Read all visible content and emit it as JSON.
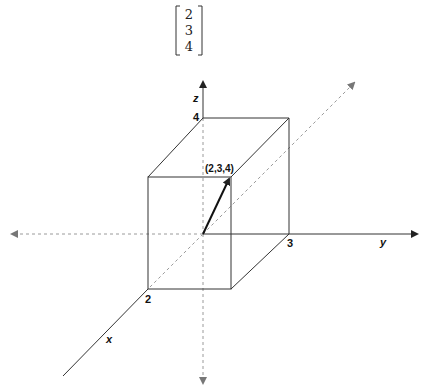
{
  "matrix": {
    "entries": [
      "2",
      "3",
      "4"
    ]
  },
  "axes": {
    "x_label": "x",
    "y_label": "y",
    "z_label": "z"
  },
  "ticks": {
    "x": "2",
    "y": "3",
    "z": "4"
  },
  "vector": {
    "label": "(2,3,4)",
    "components": [
      2,
      3,
      4
    ]
  },
  "colors": {
    "solid_line": "#333333",
    "dashed_line": "#9a9a9a",
    "vector": "#111111"
  }
}
